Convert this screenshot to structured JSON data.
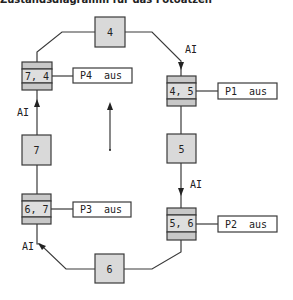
{
  "caption": "Zustandsdiagramm für das Fotoätzen",
  "states": [
    {
      "id": "4",
      "label": "4"
    },
    {
      "id": "5",
      "label": "5"
    },
    {
      "id": "6",
      "label": "6"
    },
    {
      "id": "7",
      "label": "7"
    }
  ],
  "transitions": [
    {
      "id": "4-5",
      "label": "4, 5",
      "action": "P1  aus"
    },
    {
      "id": "5-6",
      "label": "5, 6",
      "action": "P2  aus"
    },
    {
      "id": "6-7",
      "label": "6, 7",
      "action": "P3  aus"
    },
    {
      "id": "7-4",
      "label": "7, 4",
      "action": "P4  aus"
    }
  ],
  "edge_labels": {
    "top_right": "AI",
    "right": "AI",
    "bottom_left": "AI",
    "left": "AI"
  }
}
